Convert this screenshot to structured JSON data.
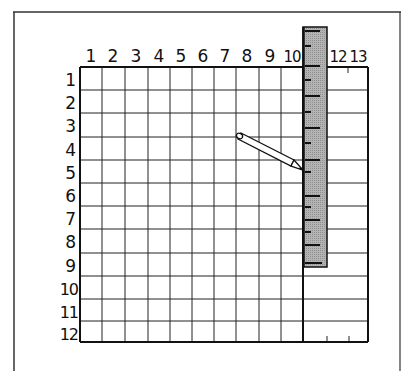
{
  "figure": {
    "column_labels": [
      "1",
      "2",
      "3",
      "4",
      "5",
      "6",
      "7",
      "8",
      "9",
      "10",
      "12",
      "13"
    ],
    "row_labels": [
      "1",
      "2",
      "3",
      "4",
      "5",
      "6",
      "7",
      "8",
      "9",
      "10",
      "11",
      "12"
    ],
    "grid": {
      "columns": 13,
      "rows": 12
    },
    "ruler": {
      "color": "#a8a8a8",
      "position_column": 11,
      "extends_from_row": 0,
      "extends_to_row": 9
    },
    "pencil": {
      "from": "between column 7-8, row 3-4",
      "to": "ruler edge at row 5"
    },
    "colors": {
      "line": "#111111",
      "ruler_fill": "#a8a8a8",
      "background": "#ffffff"
    }
  }
}
